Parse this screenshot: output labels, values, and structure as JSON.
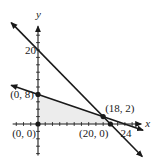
{
  "chart_data": {
    "type": "line",
    "title": "",
    "xlabel": "x",
    "ylabel": "y",
    "xlim": [
      -7.5,
      29
    ],
    "ylim": [
      -8.5,
      27.5
    ],
    "grid": false,
    "tick_step": 2,
    "series": [
      {
        "name": "x + y = 20",
        "points": [
          [
            -7.4,
            27.4
          ],
          [
            28.8,
            -8.8
          ]
        ],
        "arrows": "both"
      },
      {
        "name": "x + 3y = 24",
        "points": [
          [
            -7.4,
            10.47
          ],
          [
            29.0,
            -1.67
          ]
        ],
        "arrows": "both"
      }
    ],
    "feasible_region": {
      "vertices": [
        [
          0,
          0
        ],
        [
          0,
          8
        ],
        [
          18,
          2
        ],
        [
          20,
          0
        ]
      ],
      "fill": "#ececec"
    },
    "points": [
      {
        "x": 0,
        "y": 0,
        "label": "(0, 0)",
        "label_pos": "below-left"
      },
      {
        "x": 0,
        "y": 8,
        "label": "(0, 8)",
        "label_pos": "left"
      },
      {
        "x": 18,
        "y": 2,
        "label": "(18, 2)",
        "label_pos": "above-right"
      },
      {
        "x": 20,
        "y": 0,
        "label": "(20, 0)",
        "label_pos": "below-left"
      }
    ],
    "tick_labels": [
      {
        "axis": "y",
        "value": 20,
        "label": "20"
      },
      {
        "axis": "x",
        "value": 24,
        "label": "24"
      }
    ],
    "line_color": "#1a1a1a"
  }
}
